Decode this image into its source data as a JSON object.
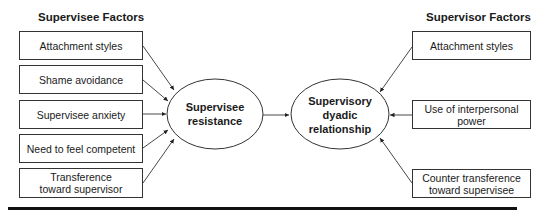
{
  "supervisee_factors": {
    "heading": "Supervisee Factors",
    "items": [
      {
        "label": "Attachment styles"
      },
      {
        "label": "Shame avoidance"
      },
      {
        "label": "Supervisee anxiety"
      },
      {
        "label": "Need to feel competent"
      },
      {
        "label": "Transference toward supervisor"
      }
    ]
  },
  "supervisor_factors": {
    "heading": "Supervisor Factors",
    "items": [
      {
        "label": "Attachment styles"
      },
      {
        "label": "Use of interpersonal power"
      },
      {
        "label": "Counter transference toward supervisee"
      }
    ]
  },
  "nodes": {
    "resistance": {
      "label": "Supervisee resistance"
    },
    "relationship": {
      "label": "Supervisory dyadic relationship"
    }
  }
}
